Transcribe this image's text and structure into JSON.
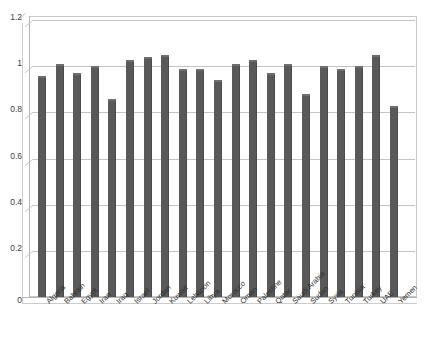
{
  "chart_data": {
    "type": "bar",
    "title": "",
    "xlabel": "",
    "ylabel": "",
    "ylim": [
      0,
      1.2
    ],
    "yticks": [
      "0",
      "0.2",
      "0.4",
      "0.6",
      "0.8",
      "1",
      "1.2"
    ],
    "ytick_values": [
      0,
      0.2,
      0.4,
      0.6,
      0.8,
      1.0,
      1.2
    ],
    "grid": true,
    "legend": "none",
    "bar_color": "#595959",
    "gridline_color": "#c4c4c4",
    "categories": [
      "Algeria",
      "Bahrain",
      "Egypt",
      "Iran",
      "Iraq",
      "Israel",
      "Jordan",
      "Kuwait",
      "Lebanon",
      "Libya",
      "Morocco",
      "Oman",
      "Palestine",
      "Qatar",
      "Saudi Arabia",
      "Sudan",
      "Syria",
      "Tunisia",
      "Turkey",
      "UAE",
      "Yemen"
    ],
    "values": [
      0.95,
      1.0,
      0.96,
      0.99,
      0.85,
      1.02,
      1.03,
      1.04,
      0.98,
      0.98,
      0.93,
      1.0,
      1.02,
      0.96,
      1.0,
      0.87,
      0.99,
      0.98,
      0.99,
      1.04,
      0.82
    ]
  }
}
